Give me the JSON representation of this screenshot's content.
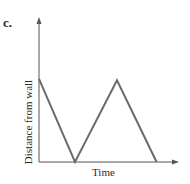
{
  "panel_label": "c.",
  "chart_data": {
    "type": "line",
    "title": "",
    "xlabel": "Time",
    "ylabel": "Distance from wall",
    "grid": false,
    "legend": null,
    "ticks": "none",
    "series": [
      {
        "name": "distance",
        "points": [
          {
            "x": 0.0,
            "y": 0.67
          },
          {
            "x": 0.3,
            "y": 0.0
          },
          {
            "x": 0.65,
            "y": 0.66
          },
          {
            "x": 0.98,
            "y": 0.0
          }
        ]
      }
    ],
    "line_color": "#6b6b6b"
  }
}
